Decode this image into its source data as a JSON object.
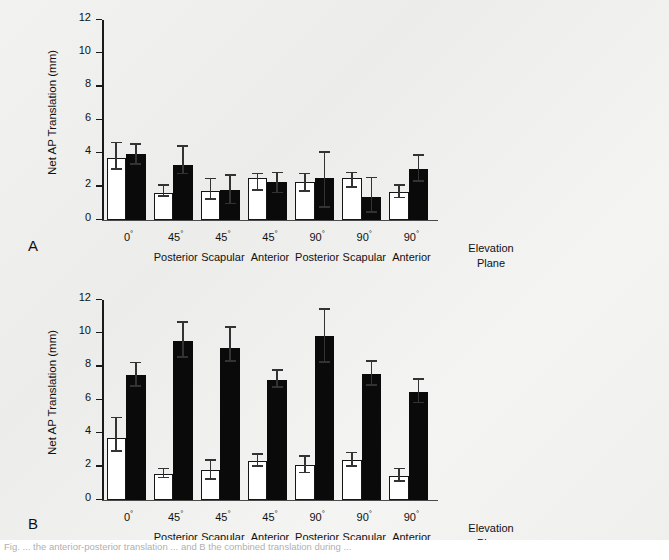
{
  "figure": {
    "panel_a_letter": "A",
    "panel_b_letter": "B",
    "axis_caption": "Elevation Plane",
    "axis_caption_line1": "Elevation",
    "axis_caption_line2": "Plane",
    "caption_partial": "Fig. ... the anterior-posterior translation ... and B the combined translation during ..."
  },
  "chart_data": [
    {
      "type": "bar",
      "panel": "A",
      "title": "",
      "xlabel": "Elevation Plane",
      "ylabel": "Net AP Translation (mm)",
      "ylim": [
        0,
        12
      ],
      "yticks": [
        0,
        2,
        4,
        6,
        8,
        10,
        12
      ],
      "ytick_labels": [
        "0",
        "2",
        "4",
        "6",
        "8",
        "10",
        "12"
      ],
      "grid": false,
      "legend": "none",
      "categories": [
        "0°",
        "45°",
        "45°",
        "45°",
        "90°",
        "90°",
        "90°"
      ],
      "category_sublabels": [
        "",
        "Posterior",
        "Scapular",
        "Anterior",
        "Posterior",
        "Scapular",
        "Anterior"
      ],
      "series": [
        {
          "name": "white",
          "fill": "#ffffff",
          "values": [
            3.75,
            1.65,
            1.75,
            2.55,
            2.3,
            2.5,
            1.7
          ],
          "err_low": [
            3.0,
            1.4,
            1.2,
            1.75,
            1.7,
            1.95,
            1.3
          ],
          "err_high": [
            4.6,
            2.05,
            2.45,
            2.75,
            2.75,
            2.8,
            2.05
          ]
        },
        {
          "name": "black",
          "fill": "#0a0a0a",
          "values": [
            3.95,
            3.3,
            1.8,
            2.3,
            2.55,
            1.4,
            3.05
          ],
          "err_low": [
            3.3,
            2.75,
            0.95,
            1.6,
            0.75,
            0.45,
            2.3
          ],
          "err_high": [
            4.5,
            4.4,
            2.65,
            2.8,
            4.05,
            2.5,
            3.85
          ]
        }
      ]
    },
    {
      "type": "bar",
      "panel": "B",
      "title": "",
      "xlabel": "Elevation Plane",
      "ylabel": "Net AP Translation (mm)",
      "ylim": [
        0,
        12
      ],
      "yticks": [
        0,
        2,
        4,
        6,
        8,
        10,
        12
      ],
      "ytick_labels": [
        "0",
        "2",
        "4",
        "6",
        "8",
        "10",
        "12"
      ],
      "grid": false,
      "legend": "none",
      "categories": [
        "0°",
        "45°",
        "45°",
        "45°",
        "90°",
        "90°",
        "90°"
      ],
      "category_sublabels": [
        "",
        "Posterior",
        "Scapular",
        "Anterior",
        "Posterior",
        "Scapular",
        "Anterior"
      ],
      "series": [
        {
          "name": "white",
          "fill": "#ffffff",
          "values": [
            3.75,
            1.55,
            1.8,
            2.35,
            2.1,
            2.4,
            1.45
          ],
          "err_low": [
            2.9,
            1.3,
            1.2,
            2.0,
            1.6,
            2.0,
            1.1
          ],
          "err_high": [
            4.9,
            1.85,
            2.35,
            2.7,
            2.6,
            2.8,
            1.85
          ]
        },
        {
          "name": "black",
          "fill": "#0a0a0a",
          "values": [
            7.5,
            9.55,
            9.15,
            7.2,
            9.85,
            7.55,
            6.5
          ],
          "err_low": [
            6.8,
            8.55,
            8.3,
            6.75,
            8.25,
            6.85,
            5.8
          ],
          "err_high": [
            8.2,
            10.65,
            10.35,
            7.75,
            11.4,
            8.3,
            7.2
          ]
        }
      ]
    }
  ]
}
